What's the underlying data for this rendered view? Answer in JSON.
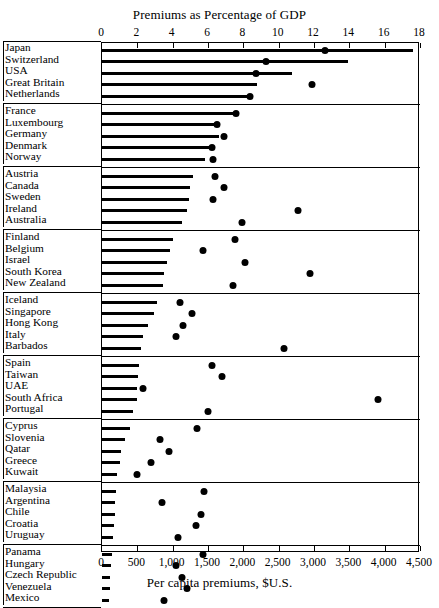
{
  "chart_data": {
    "type": "bar",
    "title": "Premiums as Percentage of GDP",
    "subtitle": "Per capita premiums, $U.S.",
    "top_axis": {
      "label": "Premiums as Percentage of GDP",
      "min": 0,
      "max": 18,
      "ticks": [
        0,
        2,
        4,
        6,
        8,
        10,
        12,
        14,
        16,
        18
      ],
      "tick_labels": [
        "0",
        "2",
        "4",
        "6",
        "8",
        "10",
        "12",
        "14",
        "16",
        "18"
      ],
      "series_name": "Premiums as percentage of GDP",
      "marker": "dot"
    },
    "bottom_axis": {
      "label": "Per capita premiums, $U.S.",
      "min": 0,
      "max": 4500,
      "ticks": [
        0,
        500,
        1000,
        1500,
        2000,
        2500,
        3000,
        3500,
        4000,
        4500
      ],
      "tick_labels": [
        "0",
        "500",
        "1,000",
        "1,500",
        "2,000",
        "2,500",
        "3,000",
        "3,500",
        "4,000",
        "4,500"
      ],
      "series_name": "Per capita premiums",
      "marker": "bar"
    },
    "grid": false,
    "legend": "none",
    "colors": {
      "bar": "#000000",
      "dot": "#000000",
      "axis": "#000000",
      "background": "#ffffff"
    },
    "groups": [
      {
        "rows": [
          {
            "country": "Japan",
            "per_capita": 4400,
            "pct_gdp": 12.6
          },
          {
            "country": "Switzerland",
            "per_capita": 3480,
            "pct_gdp": 9.3
          },
          {
            "country": "USA",
            "per_capita": 2690,
            "pct_gdp": 8.7
          },
          {
            "country": "Great Britain",
            "per_capita": 2200,
            "pct_gdp": 11.9
          },
          {
            "country": "Netherlands",
            "per_capita": 2060,
            "pct_gdp": 8.4
          }
        ]
      },
      {
        "rows": [
          {
            "country": "France",
            "per_capita": 1880,
            "pct_gdp": 7.6
          },
          {
            "country": "Luxembourg",
            "per_capita": 1590,
            "pct_gdp": 6.5
          },
          {
            "country": "Germany",
            "per_capita": 1660,
            "pct_gdp": 6.9
          },
          {
            "country": "Denmark",
            "per_capita": 1520,
            "pct_gdp": 6.2
          },
          {
            "country": "Norway",
            "per_capita": 1460,
            "pct_gdp": 6.3
          }
        ]
      },
      {
        "rows": [
          {
            "country": "Austria",
            "per_capita": 1290,
            "pct_gdp": 6.4
          },
          {
            "country": "Canada",
            "per_capita": 1250,
            "pct_gdp": 6.9
          },
          {
            "country": "Sweden",
            "per_capita": 1230,
            "pct_gdp": 6.3
          },
          {
            "country": "Ireland",
            "per_capita": 1200,
            "pct_gdp": 11.1
          },
          {
            "country": "Australia",
            "per_capita": 1130,
            "pct_gdp": 7.9
          }
        ]
      },
      {
        "rows": [
          {
            "country": "Finland",
            "per_capita": 1000,
            "pct_gdp": 7.5
          },
          {
            "country": "Belgium",
            "per_capita": 960,
            "pct_gdp": 5.7
          },
          {
            "country": "Israel",
            "per_capita": 920,
            "pct_gdp": 8.1
          },
          {
            "country": "South Korea",
            "per_capita": 880,
            "pct_gdp": 11.8
          },
          {
            "country": "New Zealand",
            "per_capita": 860,
            "pct_gdp": 7.4
          }
        ]
      },
      {
        "rows": [
          {
            "country": "Iceland",
            "per_capita": 780,
            "pct_gdp": 4.4
          },
          {
            "country": "Singapore",
            "per_capita": 740,
            "pct_gdp": 5.1
          },
          {
            "country": "Hong Kong",
            "per_capita": 650,
            "pct_gdp": 4.6
          },
          {
            "country": "Italy",
            "per_capita": 575,
            "pct_gdp": 4.2
          },
          {
            "country": "Barbados",
            "per_capita": 545,
            "pct_gdp": 10.3
          }
        ]
      },
      {
        "rows": [
          {
            "country": "Spain",
            "per_capita": 530,
            "pct_gdp": 6.2
          },
          {
            "country": "Taiwan",
            "per_capita": 510,
            "pct_gdp": 6.8
          },
          {
            "country": "UAE",
            "per_capita": 500,
            "pct_gdp": 2.3
          },
          {
            "country": "South Africa",
            "per_capita": 490,
            "pct_gdp": 15.6
          },
          {
            "country": "Portugal",
            "per_capita": 440,
            "pct_gdp": 6.0
          }
        ]
      },
      {
        "rows": [
          {
            "country": "Cyprus",
            "per_capita": 390,
            "pct_gdp": 5.4
          },
          {
            "country": "Slovenia",
            "per_capita": 320,
            "pct_gdp": 3.3
          },
          {
            "country": "Qatar",
            "per_capita": 270,
            "pct_gdp": 3.8
          },
          {
            "country": "Greece",
            "per_capita": 250,
            "pct_gdp": 2.8
          },
          {
            "country": "Kuwait",
            "per_capita": 215,
            "pct_gdp": 2.0
          }
        ]
      },
      {
        "rows": [
          {
            "country": "Malaysia",
            "per_capita": 200,
            "pct_gdp": 5.8
          },
          {
            "country": "Argentina",
            "per_capita": 190,
            "pct_gdp": 3.4
          },
          {
            "country": "Chile",
            "per_capita": 180,
            "pct_gdp": 5.6
          },
          {
            "country": "Croatia",
            "per_capita": 165,
            "pct_gdp": 5.3
          },
          {
            "country": "Uruguay",
            "per_capita": 150,
            "pct_gdp": 4.3
          }
        ]
      },
      {
        "rows": [
          {
            "country": "Panama",
            "per_capita": 140,
            "pct_gdp": 5.7
          },
          {
            "country": "Hungary",
            "per_capita": 130,
            "pct_gdp": 4.2
          },
          {
            "country": "Czech Republic",
            "per_capita": 120,
            "pct_gdp": 4.5
          },
          {
            "country": "Venezuela",
            "per_capita": 110,
            "pct_gdp": 4.8
          },
          {
            "country": "Mexico",
            "per_capita": 100,
            "pct_gdp": 3.5
          }
        ]
      }
    ]
  }
}
